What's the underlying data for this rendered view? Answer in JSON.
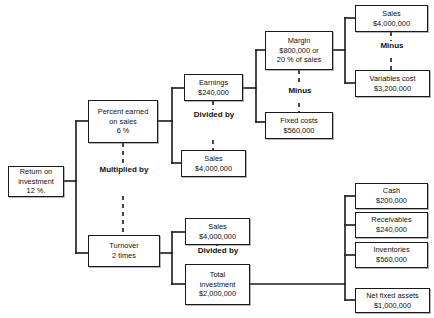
{
  "diagram": {
    "type": "tree-diagram",
    "colors": {
      "box_border": "#1a1a1a",
      "text": "#111111",
      "background": "#ffffff",
      "line": "#1a1a1a"
    },
    "nodes": [
      {
        "id": "roi",
        "name": "return-on-investment",
        "lines": [
          "Return on",
          "investment",
          "12 %."
        ]
      },
      {
        "id": "pct",
        "name": "percent-earned-on-sales",
        "lines": [
          "Percent earned",
          "on sales",
          "6 %"
        ]
      },
      {
        "id": "turnover",
        "name": "turnover",
        "lines": [
          "Turnover",
          "2 times"
        ]
      },
      {
        "id": "earnings",
        "name": "earnings",
        "lines": [
          "Earnings",
          "$240,000"
        ]
      },
      {
        "id": "sales1",
        "name": "sales-upper",
        "lines": [
          "Sales",
          "$4,000,000"
        ]
      },
      {
        "id": "margin",
        "name": "margin",
        "lines": [
          "Margin",
          "$800,000 or",
          "20 % of sales"
        ]
      },
      {
        "id": "fixed",
        "name": "fixed-costs",
        "lines": [
          "Fixed costs",
          "$560,000"
        ]
      },
      {
        "id": "sales2",
        "name": "sales-top-right",
        "lines": [
          "Sales",
          "$4,000,000"
        ]
      },
      {
        "id": "varcost",
        "name": "variables-cost",
        "lines": [
          "Variables cost",
          "$3,200,000"
        ]
      },
      {
        "id": "sales3",
        "name": "sales-lower",
        "lines": [
          "Sales",
          "$4,000,000"
        ]
      },
      {
        "id": "totalinv",
        "name": "total-investment",
        "lines": [
          "Total",
          "investment",
          "$2,000,000"
        ]
      },
      {
        "id": "cash",
        "name": "cash",
        "lines": [
          "Cash",
          "$200,000"
        ]
      },
      {
        "id": "receivables",
        "name": "receivables",
        "lines": [
          "Receivables",
          "$240,000"
        ]
      },
      {
        "id": "inventories",
        "name": "inventories",
        "lines": [
          "Inventories",
          "$560,000"
        ]
      },
      {
        "id": "netfixed",
        "name": "net-fixed-assets",
        "lines": [
          "Net fixed assets",
          "$1,000,000"
        ]
      }
    ],
    "operators": [
      {
        "id": "op_mult",
        "name": "operator-multiplied-by",
        "lines": [
          "Multiplied",
          "by"
        ]
      },
      {
        "id": "op_div1",
        "name": "operator-divided-by-upper",
        "lines": [
          "Divided",
          "by"
        ]
      },
      {
        "id": "op_div2",
        "name": "operator-divided-by-lower",
        "lines": [
          "Divided",
          "by"
        ]
      },
      {
        "id": "op_minus1",
        "name": "operator-minus-margin",
        "lines": [
          "Minus"
        ]
      },
      {
        "id": "op_minus2",
        "name": "operator-minus-sales",
        "lines": [
          "Minus"
        ]
      }
    ]
  }
}
